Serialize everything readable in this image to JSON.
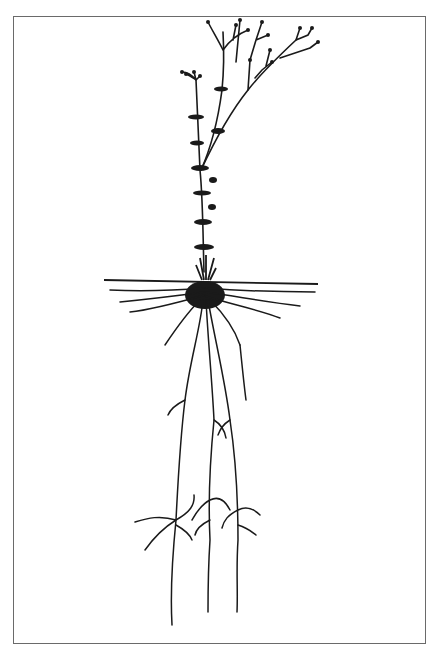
{
  "figure": {
    "parts": [
      "branching flower stems",
      "whorled leaves",
      "ground line",
      "fibrous surface roots",
      "deep tap roots"
    ],
    "colors": {
      "ink": "#1a1a1a",
      "frame": "#6a6a6a",
      "background": "#ffffff"
    }
  }
}
